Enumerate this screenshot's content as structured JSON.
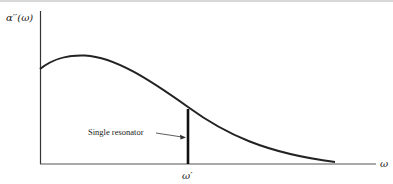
{
  "figure": {
    "y_axis_label": "α′′(ω)",
    "x_axis_label": "ω",
    "tick_label": "ω′",
    "annotation": "Single resonator",
    "colors": {
      "ink": "#222222",
      "background": "#ffffff"
    }
  }
}
